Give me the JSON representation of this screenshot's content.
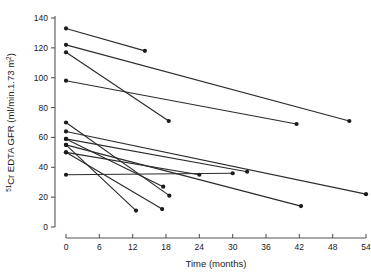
{
  "chart_data": {
    "type": "line",
    "title": "",
    "xlabel": "Time (months)",
    "ylabel_parts": {
      "superscript": "51",
      "main": "Cr EDTA GFR (ml/min.1.73 m",
      "sup2": "2",
      "tail": ")"
    },
    "ylabel": "51Cr EDTA GFR (ml/min.1.73 m2)",
    "xlim": [
      0,
      54
    ],
    "ylim": [
      0,
      140
    ],
    "xticks": [
      0,
      6,
      12,
      18,
      24,
      30,
      36,
      42,
      48,
      54
    ],
    "yticks": [
      0,
      20,
      40,
      60,
      80,
      100,
      120,
      140
    ],
    "xtick_labels": [
      "0",
      "6",
      "12",
      "18",
      "24",
      "30",
      "36",
      "42",
      "48",
      "54"
    ],
    "ytick_labels": [
      "0",
      "20",
      "40",
      "60",
      "80",
      "100",
      "120",
      "140"
    ],
    "grid": false,
    "legend": "none",
    "marker": "filled-circle",
    "line_color": "#2b2b2b",
    "marker_color": "#1a1a1a",
    "axis_color": "#555555",
    "series": [
      {
        "name": "patient-1",
        "x": [
          0,
          14.2
        ],
        "values": [
          133,
          118
        ]
      },
      {
        "name": "patient-2",
        "x": [
          0,
          51.0
        ],
        "values": [
          122,
          71
        ]
      },
      {
        "name": "patient-3",
        "x": [
          0,
          18.5
        ],
        "values": [
          117,
          71
        ]
      },
      {
        "name": "patient-4",
        "x": [
          0,
          41.5
        ],
        "values": [
          98,
          69
        ]
      },
      {
        "name": "patient-5",
        "x": [
          0,
          18.6
        ],
        "values": [
          70,
          21
        ]
      },
      {
        "name": "patient-6",
        "x": [
          0,
          54.0
        ],
        "values": [
          64,
          22
        ]
      },
      {
        "name": "patient-7",
        "x": [
          0,
          32.6
        ],
        "values": [
          59,
          37
        ]
      },
      {
        "name": "patient-8",
        "x": [
          0,
          42.3
        ],
        "values": [
          55,
          14
        ]
      },
      {
        "name": "patient-9",
        "x": [
          0,
          24.0
        ],
        "values": [
          50,
          35
        ]
      },
      {
        "name": "patient-10",
        "x": [
          0,
          17.5
        ],
        "values": [
          59,
          27
        ]
      },
      {
        "name": "patient-11",
        "x": [
          0,
          12.6
        ],
        "values": [
          55,
          11
        ]
      },
      {
        "name": "patient-12",
        "x": [
          0,
          30.0
        ],
        "values": [
          35,
          36
        ]
      },
      {
        "name": "patient-13",
        "x": [
          0,
          17.3
        ],
        "values": [
          50,
          12
        ]
      }
    ]
  }
}
